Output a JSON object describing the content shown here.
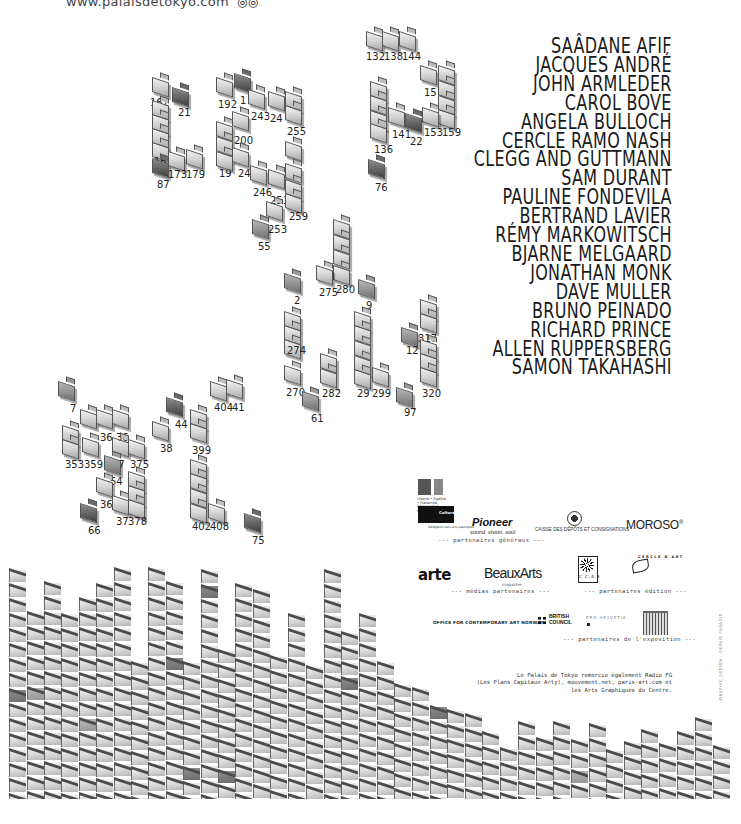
{
  "header": {
    "url_text": "www.palaisdetokyo.com",
    "glyph": "◎◎"
  },
  "artists": [
    "SAÂDANE AFIF",
    "JACQUES ANDRÉ",
    "JOHN ARMLEDER",
    "CAROL BOVE",
    "ANGELA BULLOCH",
    "CERCLE RAMO NASH",
    "CLEGG AND GUTTMANN",
    "SAM DURANT",
    "PAULINE FONDEVILA",
    "BERTRAND LAVIER",
    "RÉMY MARKOWITSCH",
    "BJARNE MELGAARD",
    "JONATHAN MONK",
    "DAVE MULLER",
    "BRUNO PEINADO",
    "RICHARD PRINCE",
    "ALLEN RUPPERSBERG",
    "SAMON TAKAHASHI"
  ],
  "folders": [
    {
      "x": 152,
      "y": 74,
      "t": "l",
      "label": "162",
      "lx": 150,
      "ly": 98
    },
    {
      "x": 172,
      "y": 84,
      "t": "d",
      "label": "21",
      "lx": 178,
      "ly": 108
    },
    {
      "x": 152,
      "y": 97,
      "t": "l"
    },
    {
      "x": 152,
      "y": 111,
      "t": "l"
    },
    {
      "x": 152,
      "y": 125,
      "t": "l"
    },
    {
      "x": 152,
      "y": 139,
      "t": "l",
      "label": "16",
      "lx": 154,
      "ly": 157
    },
    {
      "x": 152,
      "y": 155,
      "t": "d",
      "label": "87",
      "lx": 157,
      "ly": 180
    },
    {
      "x": 168,
      "y": 148,
      "t": "l",
      "label": "173",
      "lx": 168,
      "ly": 170
    },
    {
      "x": 186,
      "y": 146,
      "t": "l",
      "label": "179",
      "lx": 186,
      "ly": 170
    },
    {
      "x": 216,
      "y": 74,
      "t": "l",
      "label": "192",
      "lx": 218,
      "ly": 100
    },
    {
      "x": 234,
      "y": 70,
      "t": "d",
      "label": "1",
      "lx": 240,
      "ly": 96
    },
    {
      "x": 248,
      "y": 86,
      "t": "l",
      "label": "243",
      "lx": 251,
      "ly": 112
    },
    {
      "x": 268,
      "y": 88,
      "t": "l",
      "label": "24",
      "lx": 270,
      "ly": 114
    },
    {
      "x": 285,
      "y": 88,
      "t": "l"
    },
    {
      "x": 285,
      "y": 102,
      "t": "l",
      "label": "255",
      "lx": 287,
      "ly": 127
    },
    {
      "x": 232,
      "y": 108,
      "t": "l",
      "label": "200",
      "lx": 234,
      "ly": 136
    },
    {
      "x": 216,
      "y": 118,
      "t": "l"
    },
    {
      "x": 216,
      "y": 133,
      "t": "l",
      "label": "19",
      "lx": 219,
      "ly": 169
    },
    {
      "x": 216,
      "y": 148,
      "t": "l"
    },
    {
      "x": 232,
      "y": 144,
      "t": "l",
      "label": "24",
      "lx": 238,
      "ly": 169
    },
    {
      "x": 250,
      "y": 162,
      "t": "l",
      "label": "246",
      "lx": 253,
      "ly": 188
    },
    {
      "x": 268,
      "y": 166,
      "t": "l",
      "label": "251",
      "lx": 270,
      "ly": 196
    },
    {
      "x": 285,
      "y": 138,
      "t": "l"
    },
    {
      "x": 285,
      "y": 160,
      "t": "l"
    },
    {
      "x": 285,
      "y": 176,
      "t": "l"
    },
    {
      "x": 285,
      "y": 190,
      "t": "l",
      "label": "259",
      "lx": 289,
      "ly": 212
    },
    {
      "x": 266,
      "y": 198,
      "t": "l",
      "label": "253",
      "lx": 268,
      "ly": 225
    },
    {
      "x": 252,
      "y": 216,
      "t": "m",
      "label": "55",
      "lx": 258,
      "ly": 242
    },
    {
      "x": 366,
      "y": 28,
      "t": "l"
    },
    {
      "x": 382,
      "y": 28,
      "t": "l"
    },
    {
      "x": 399,
      "y": 28,
      "t": "l"
    },
    {
      "x": 366,
      "y": 50,
      "t": "n",
      "label": "132",
      "lx": 366,
      "ly": 52
    },
    {
      "x": 384,
      "y": 50,
      "t": "n",
      "label": "138",
      "lx": 384,
      "ly": 52
    },
    {
      "x": 400,
      "y": 50,
      "t": "n",
      "label": "144",
      "lx": 402,
      "ly": 52
    },
    {
      "x": 420,
      "y": 62,
      "t": "l",
      "label": "15",
      "lx": 424,
      "ly": 88
    },
    {
      "x": 438,
      "y": 62,
      "t": "l"
    },
    {
      "x": 438,
      "y": 77,
      "t": "l"
    },
    {
      "x": 438,
      "y": 92,
      "t": "l"
    },
    {
      "x": 438,
      "y": 106,
      "t": "l",
      "label": "159",
      "lx": 442,
      "ly": 128
    },
    {
      "x": 422,
      "y": 104,
      "t": "l",
      "label": "153",
      "lx": 424,
      "ly": 128
    },
    {
      "x": 370,
      "y": 78,
      "t": "l"
    },
    {
      "x": 370,
      "y": 92,
      "t": "l"
    },
    {
      "x": 370,
      "y": 107,
      "t": "l"
    },
    {
      "x": 370,
      "y": 120,
      "t": "l",
      "label": "136",
      "lx": 374,
      "ly": 145
    },
    {
      "x": 388,
      "y": 104,
      "t": "l",
      "label": "141",
      "lx": 392,
      "ly": 130
    },
    {
      "x": 405,
      "y": 110,
      "t": "d",
      "label": "22",
      "lx": 410,
      "ly": 137
    },
    {
      "x": 368,
      "y": 156,
      "t": "d",
      "label": "76",
      "lx": 375,
      "ly": 183
    },
    {
      "x": 333,
      "y": 216,
      "t": "l"
    },
    {
      "x": 333,
      "y": 231,
      "t": "l"
    },
    {
      "x": 333,
      "y": 246,
      "t": "l"
    },
    {
      "x": 333,
      "y": 262,
      "t": "l",
      "label": "280",
      "lx": 336,
      "ly": 285
    },
    {
      "x": 316,
      "y": 262,
      "t": "l",
      "label": "275",
      "lx": 319,
      "ly": 288
    },
    {
      "x": 358,
      "y": 276,
      "t": "m",
      "label": "9",
      "lx": 366,
      "ly": 301
    },
    {
      "x": 284,
      "y": 270,
      "t": "m",
      "label": "2",
      "lx": 294,
      "ly": 296
    },
    {
      "x": 284,
      "y": 308,
      "t": "l"
    },
    {
      "x": 284,
      "y": 322,
      "t": "l"
    },
    {
      "x": 284,
      "y": 336,
      "t": "l",
      "label": "274",
      "lx": 287,
      "ly": 346
    },
    {
      "x": 284,
      "y": 362,
      "t": "l",
      "label": "270",
      "lx": 286,
      "ly": 388
    },
    {
      "x": 302,
      "y": 388,
      "t": "m",
      "label": "61",
      "lx": 311,
      "ly": 414
    },
    {
      "x": 320,
      "y": 350,
      "t": "l"
    },
    {
      "x": 320,
      "y": 365,
      "t": "l",
      "label": "282",
      "lx": 322,
      "ly": 389
    },
    {
      "x": 354,
      "y": 308,
      "t": "l"
    },
    {
      "x": 354,
      "y": 322,
      "t": "l"
    },
    {
      "x": 354,
      "y": 337,
      "t": "l"
    },
    {
      "x": 354,
      "y": 352,
      "t": "l"
    },
    {
      "x": 354,
      "y": 366,
      "t": "l",
      "label": "29",
      "lx": 357,
      "ly": 389
    },
    {
      "x": 372,
      "y": 364,
      "t": "l",
      "label": "299",
      "lx": 372,
      "ly": 389
    },
    {
      "x": 420,
      "y": 296,
      "t": "l"
    },
    {
      "x": 420,
      "y": 310,
      "t": "l",
      "label": "317",
      "lx": 418,
      "ly": 334
    },
    {
      "x": 401,
      "y": 324,
      "t": "m",
      "label": "12",
      "lx": 406,
      "ly": 346
    },
    {
      "x": 420,
      "y": 336,
      "t": "l"
    },
    {
      "x": 420,
      "y": 350,
      "t": "l"
    },
    {
      "x": 420,
      "y": 364,
      "t": "l",
      "label": "320",
      "lx": 422,
      "ly": 389
    },
    {
      "x": 396,
      "y": 384,
      "t": "m",
      "label": "97",
      "lx": 404,
      "ly": 408
    },
    {
      "x": 58,
      "y": 378,
      "t": "m",
      "label": "7",
      "lx": 70,
      "ly": 404
    },
    {
      "x": 80,
      "y": 406,
      "t": "l"
    },
    {
      "x": 96,
      "y": 406,
      "t": "l",
      "label": "36",
      "lx": 100,
      "ly": 433
    },
    {
      "x": 112,
      "y": 406,
      "t": "l",
      "label": "36",
      "lx": 116,
      "ly": 433
    },
    {
      "x": 62,
      "y": 422,
      "t": "l"
    },
    {
      "x": 62,
      "y": 436,
      "t": "l",
      "label": "353",
      "lx": 65,
      "ly": 460
    },
    {
      "x": 82,
      "y": 434,
      "t": "l",
      "label": "359",
      "lx": 84,
      "ly": 460
    },
    {
      "x": 112,
      "y": 434,
      "t": "l",
      "label": "37",
      "lx": 112,
      "ly": 460
    },
    {
      "x": 128,
      "y": 436,
      "t": "l",
      "label": "375",
      "lx": 130,
      "ly": 460
    },
    {
      "x": 104,
      "y": 452,
      "t": "m",
      "label": "54",
      "lx": 110,
      "ly": 477
    },
    {
      "x": 96,
      "y": 474,
      "t": "l",
      "label": "36",
      "lx": 100,
      "ly": 500
    },
    {
      "x": 128,
      "y": 468,
      "t": "l"
    },
    {
      "x": 128,
      "y": 482,
      "t": "l"
    },
    {
      "x": 112,
      "y": 492,
      "t": "l",
      "label": "37",
      "lx": 116,
      "ly": 517
    },
    {
      "x": 128,
      "y": 496,
      "t": "l",
      "label": "378",
      "lx": 128,
      "ly": 517
    },
    {
      "x": 80,
      "y": 500,
      "t": "d",
      "label": "66",
      "lx": 88,
      "ly": 526
    },
    {
      "x": 166,
      "y": 394,
      "t": "d",
      "label": "44",
      "lx": 175,
      "ly": 420
    },
    {
      "x": 152,
      "y": 418,
      "t": "l",
      "label": "38",
      "lx": 160,
      "ly": 444
    },
    {
      "x": 190,
      "y": 406,
      "t": "l"
    },
    {
      "x": 190,
      "y": 420,
      "t": "l",
      "label": "399",
      "lx": 192,
      "ly": 446
    },
    {
      "x": 210,
      "y": 378,
      "t": "l",
      "label": "404",
      "lx": 214,
      "ly": 403
    },
    {
      "x": 226,
      "y": 376,
      "t": "l",
      "label": "41",
      "lx": 232,
      "ly": 403
    },
    {
      "x": 190,
      "y": 456,
      "t": "l"
    },
    {
      "x": 190,
      "y": 470,
      "t": "l"
    },
    {
      "x": 190,
      "y": 485,
      "t": "l"
    },
    {
      "x": 190,
      "y": 500,
      "t": "l",
      "label": "402",
      "lx": 192,
      "ly": 522
    },
    {
      "x": 208,
      "y": 500,
      "t": "l",
      "label": "408",
      "lx": 210,
      "ly": 522
    },
    {
      "x": 244,
      "y": 510,
      "t": "d",
      "label": "75",
      "lx": 252,
      "ly": 536
    }
  ],
  "wall": {
    "bottom": 799,
    "columns": [
      {
        "x": 8,
        "top": 567,
        "dark": [
          8
        ],
        "mid": []
      },
      {
        "x": 26,
        "top": 610,
        "dark": [],
        "mid": [
          5
        ]
      },
      {
        "x": 43,
        "top": 580,
        "dark": [],
        "mid": []
      },
      {
        "x": 60,
        "top": 612,
        "dark": [],
        "mid": []
      },
      {
        "x": 78,
        "top": 596,
        "dark": [],
        "mid": [
          8
        ]
      },
      {
        "x": 95,
        "top": 582,
        "dark": [],
        "mid": []
      },
      {
        "x": 113,
        "top": 566,
        "dark": [],
        "mid": []
      },
      {
        "x": 130,
        "top": 660,
        "dark": [],
        "mid": []
      },
      {
        "x": 147,
        "top": 566,
        "dark": [],
        "mid": []
      },
      {
        "x": 165,
        "top": 580,
        "dark": [
          5
        ],
        "mid": []
      },
      {
        "x": 182,
        "top": 660,
        "dark": [
          7
        ],
        "mid": []
      },
      {
        "x": 200,
        "top": 568,
        "dark": [
          1
        ],
        "mid": []
      },
      {
        "x": 217,
        "top": 648,
        "dark": [
          8
        ],
        "mid": []
      },
      {
        "x": 234,
        "top": 582,
        "dark": [],
        "mid": []
      },
      {
        "x": 252,
        "top": 588,
        "dark": [],
        "mid": []
      },
      {
        "x": 269,
        "top": 654,
        "dark": [],
        "mid": []
      },
      {
        "x": 287,
        "top": 612,
        "dark": [],
        "mid": []
      },
      {
        "x": 305,
        "top": 664,
        "dark": [],
        "mid": [
          10
        ]
      },
      {
        "x": 323,
        "top": 568,
        "dark": [],
        "mid": []
      },
      {
        "x": 340,
        "top": 630,
        "dark": [
          3
        ],
        "mid": []
      },
      {
        "x": 358,
        "top": 612,
        "dark": [],
        "mid": []
      },
      {
        "x": 376,
        "top": 660,
        "dark": [],
        "mid": []
      },
      {
        "x": 393,
        "top": 682,
        "dark": [],
        "mid": []
      },
      {
        "x": 411,
        "top": 686,
        "dark": [],
        "mid": []
      },
      {
        "x": 429,
        "top": 704,
        "dark": [
          0
        ],
        "mid": []
      },
      {
        "x": 446,
        "top": 708,
        "dark": [],
        "mid": []
      },
      {
        "x": 464,
        "top": 712,
        "dark": [],
        "mid": []
      },
      {
        "x": 481,
        "top": 730,
        "dark": [],
        "mid": []
      },
      {
        "x": 499,
        "top": 746,
        "dark": [],
        "mid": []
      },
      {
        "x": 517,
        "top": 720,
        "dark": [],
        "mid": []
      },
      {
        "x": 535,
        "top": 736,
        "dark": [],
        "mid": []
      },
      {
        "x": 552,
        "top": 720,
        "dark": [],
        "mid": []
      },
      {
        "x": 570,
        "top": 738,
        "dark": [],
        "mid": [
          2
        ]
      },
      {
        "x": 588,
        "top": 722,
        "dark": [],
        "mid": []
      },
      {
        "x": 605,
        "top": 748,
        "dark": [],
        "mid": []
      },
      {
        "x": 623,
        "top": 740,
        "dark": [],
        "mid": []
      },
      {
        "x": 640,
        "top": 728,
        "dark": [],
        "mid": []
      },
      {
        "x": 658,
        "top": 742,
        "dark": [],
        "mid": []
      },
      {
        "x": 676,
        "top": 730,
        "dark": [],
        "mid": []
      },
      {
        "x": 694,
        "top": 716,
        "dark": [],
        "mid": []
      },
      {
        "x": 712,
        "top": 744,
        "dark": [],
        "mid": []
      }
    ]
  },
  "sponsors": {
    "rf_text": "Liberté • Égalité • Fraternité RÉPUBLIQUE FRANÇAISE",
    "culture_text": "Culture Communication",
    "culture_sub": "Délégation aux arts plastiques",
    "pioneer": "Pioneer",
    "pioneer_sub": "sound. vision. soul",
    "cdc": "CAISSE DES DÉPÔTS ET CONSIGNATIONS",
    "moroso": "MOROSO",
    "moroso_mark": "®",
    "caption_general": "--- partenaires généraux ---",
    "arte": "arte",
    "beauxarts": "BeauxArts",
    "beauxarts_sub": "magazine",
    "caption_media": "--- médias partenaires ---",
    "ccas": "C.C.A.S",
    "cercle": "CERCLE D'ART",
    "caption_edition": "--- partenaires édition ---",
    "oca": "OFFICE FOR CONTEMPORARY ART NORWAY",
    "british_council": "BRITISH COUNCIL",
    "helvetia": "PRO HELVETIA",
    "caption_expo": "--- partenaires de l'exposition ---"
  },
  "thanks": [
    "Le Palais de Tokyo remercie également Radio FG",
    "(Les Plans Capitaux Arty), mouvement.net, paris-art.com et",
    "les Arts Graphiques du Centre."
  ],
  "credit": "GRAPHIC DESIGN : DEPUIS PARADIS"
}
